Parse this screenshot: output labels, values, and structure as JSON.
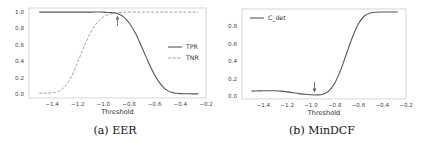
{
  "chart_data": [
    {
      "type": "line",
      "caption": "(a) EER",
      "xlabel": "Threshold",
      "ylabel": "",
      "xlim": [
        -1.58,
        -0.2
      ],
      "ylim": [
        -0.05,
        1.05
      ],
      "xticks": [
        -1.4,
        -1.2,
        -1.0,
        -0.8,
        -0.6,
        -0.4,
        -0.2
      ],
      "xtick_labels": [
        "−1.4",
        "−1.2",
        "−1.0",
        "−0.8",
        "−0.6",
        "−0.4",
        "−0.2"
      ],
      "yticks": [
        0.0,
        0.2,
        0.4,
        0.6,
        0.8,
        1.0
      ],
      "ytick_labels": [
        "0.0",
        "0.2",
        "0.4",
        "0.6",
        "0.8",
        "1.0"
      ],
      "legend_position": "center-right",
      "grid": false,
      "annotation": {
        "type": "arrow-up",
        "x": -0.89,
        "label": ""
      },
      "series": [
        {
          "name": "TPR",
          "style": "solid",
          "color": "#555555",
          "x": [
            -1.5,
            -1.4,
            -1.3,
            -1.2,
            -1.1,
            -1.0,
            -0.95,
            -0.9,
            -0.85,
            -0.8,
            -0.75,
            -0.7,
            -0.65,
            -0.6,
            -0.55,
            -0.5,
            -0.45,
            -0.4,
            -0.35,
            -0.3,
            -0.26
          ],
          "values": [
            1.0,
            1.0,
            1.0,
            1.0,
            1.0,
            1.0,
            0.995,
            0.985,
            0.95,
            0.87,
            0.74,
            0.57,
            0.39,
            0.23,
            0.11,
            0.04,
            0.012,
            0.004,
            0.002,
            0.001,
            0.001
          ]
        },
        {
          "name": "TNR",
          "style": "dashed",
          "color": "#999999",
          "x": [
            -1.5,
            -1.45,
            -1.4,
            -1.35,
            -1.3,
            -1.25,
            -1.2,
            -1.15,
            -1.1,
            -1.05,
            -1.0,
            -0.95,
            -0.9,
            -0.85,
            -0.8,
            -0.7,
            -0.6,
            -0.5,
            -0.4,
            -0.3,
            -0.26
          ],
          "values": [
            0.01,
            0.01,
            0.012,
            0.03,
            0.09,
            0.21,
            0.39,
            0.58,
            0.75,
            0.87,
            0.94,
            0.975,
            0.99,
            0.997,
            1.0,
            1.0,
            1.0,
            1.0,
            1.0,
            1.0,
            1.0
          ]
        }
      ]
    },
    {
      "type": "line",
      "caption": "(b) MinDCF",
      "xlabel": "Threshold",
      "ylabel": "",
      "xlim": [
        -1.58,
        -0.2
      ],
      "ylim": [
        -0.03,
        1.0
      ],
      "xticks": [
        -1.4,
        -1.2,
        -1.0,
        -0.8,
        -0.6,
        -0.4,
        -0.2
      ],
      "xtick_labels": [
        "−1.4",
        "−1.2",
        "−1.0",
        "−0.8",
        "−0.6",
        "−0.4",
        "−0.2"
      ],
      "yticks": [
        0.0,
        0.2,
        0.4,
        0.6,
        0.8
      ],
      "ytick_labels": [
        "0.0",
        "0.2",
        "0.4",
        "0.6",
        "0.8"
      ],
      "legend_position": "upper-left",
      "grid": false,
      "annotation": {
        "type": "arrow-down",
        "x": -0.97,
        "label": ""
      },
      "series": [
        {
          "name": "C_det",
          "style": "solid",
          "color": "#555555",
          "x": [
            -1.5,
            -1.45,
            -1.4,
            -1.35,
            -1.3,
            -1.25,
            -1.2,
            -1.15,
            -1.1,
            -1.05,
            -1.0,
            -0.95,
            -0.9,
            -0.85,
            -0.8,
            -0.75,
            -0.7,
            -0.65,
            -0.6,
            -0.55,
            -0.5,
            -0.45,
            -0.4,
            -0.35,
            -0.3,
            -0.27
          ],
          "values": [
            0.06,
            0.062,
            0.064,
            0.065,
            0.064,
            0.06,
            0.052,
            0.042,
            0.032,
            0.024,
            0.018,
            0.017,
            0.025,
            0.06,
            0.15,
            0.3,
            0.49,
            0.68,
            0.83,
            0.92,
            0.955,
            0.963,
            0.965,
            0.965,
            0.965,
            0.965
          ]
        }
      ]
    }
  ]
}
